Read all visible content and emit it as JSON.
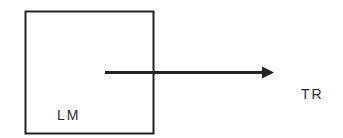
{
  "diagram": {
    "box": {
      "label": "LM"
    },
    "arrow": {
      "target_label": "TR"
    },
    "colors": {
      "stroke": "#222222",
      "text": "#2a2a2a",
      "background": "#ffffff"
    }
  }
}
